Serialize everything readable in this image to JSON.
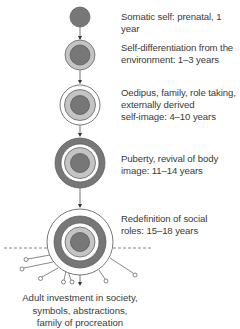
{
  "colors": {
    "dark": "#777777",
    "light": "#c4c4c4",
    "outline": "#555555",
    "line": "#555555",
    "text": "#3a3a3a"
  },
  "stages": [
    {
      "id": "somatic",
      "text": "Somatic self: prenatal, 1 year"
    },
    {
      "id": "self-differentiation",
      "line1": "Self-differentiation from the",
      "line2": "environment: 1–3 years"
    },
    {
      "id": "oedipus",
      "line1": "Oedipus, family, role taking,",
      "line2": "externally derived",
      "line3": "self-image: 4–10 years"
    },
    {
      "id": "puberty",
      "line1": "Puberty, revival of body",
      "line2": "image: 11–14 years"
    },
    {
      "id": "social-roles",
      "line1": "Redefinition of social",
      "line2": "roles: 15–18 years"
    }
  ],
  "caption": {
    "line1": "Adult investment in society,",
    "line2": "symbols, abstractions,",
    "line3": "family of procreation"
  }
}
